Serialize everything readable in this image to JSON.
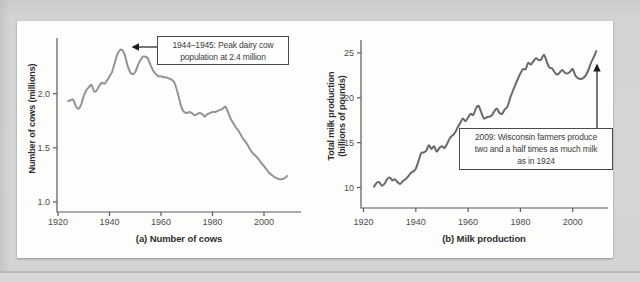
{
  "figure": {
    "kind": "textbook-two-panel-line-figure",
    "panel_a_caption": "(a) Number of cows",
    "panel_b_caption": "(b) Milk production"
  },
  "colors": {
    "page_bg": "#d4d5d2",
    "card_bg": "#fdfdfc",
    "axis": "#5b5b5b",
    "curve_a": "#939393",
    "curve_b": "#696969",
    "annotation_border": "#4a4a4a",
    "arrow": "#1b1b1b",
    "text": "#3a3a3a"
  },
  "chart_data": [
    {
      "type": "line",
      "caption": "(a) Number of cows",
      "ylabel": "Number of cows (millions)",
      "ylabel_lines": [
        "Number of cows (millions)"
      ],
      "x_ticks": [
        "1920",
        "1940",
        "1960",
        "1980",
        "2000"
      ],
      "y_ticks": [
        "1.0",
        "1.5",
        "2.0"
      ],
      "xlim": [
        1920,
        2013
      ],
      "ylim": [
        0.9,
        2.52
      ],
      "grid": false,
      "line_color": "#939393",
      "x_range": [
        1924,
        2009
      ],
      "x_step": 1,
      "values": [
        1.93,
        1.94,
        1.94,
        1.88,
        1.86,
        1.9,
        1.98,
        2.03,
        2.06,
        2.08,
        2.02,
        2.03,
        2.07,
        2.1,
        2.09,
        2.12,
        2.16,
        2.2,
        2.28,
        2.36,
        2.4,
        2.4,
        2.35,
        2.26,
        2.2,
        2.18,
        2.2,
        2.26,
        2.31,
        2.34,
        2.34,
        2.32,
        2.26,
        2.21,
        2.18,
        2.16,
        2.16,
        2.15,
        2.15,
        2.14,
        2.13,
        2.11,
        2.05,
        1.96,
        1.87,
        1.83,
        1.82,
        1.83,
        1.82,
        1.8,
        1.81,
        1.82,
        1.81,
        1.79,
        1.81,
        1.82,
        1.83,
        1.83,
        1.84,
        1.85,
        1.86,
        1.88,
        1.83,
        1.77,
        1.73,
        1.69,
        1.66,
        1.62,
        1.58,
        1.55,
        1.51,
        1.47,
        1.44,
        1.42,
        1.39,
        1.36,
        1.33,
        1.3,
        1.27,
        1.25,
        1.23,
        1.22,
        1.21,
        1.21,
        1.22,
        1.24
      ],
      "annotation": {
        "lines": [
          "1944–1945: Peak dairy cow",
          "population at 2.4 million"
        ],
        "points_to": {
          "year_range": "1944–1945",
          "value": 2.4
        }
      }
    },
    {
      "type": "line",
      "caption": "(b) Milk production",
      "ylabel": "Total milk production (billions of pounds)",
      "ylabel_lines": [
        "Total milk production",
        "(billions of pounds)"
      ],
      "x_ticks": [
        "1920",
        "1940",
        "1960",
        "1980",
        "2000"
      ],
      "y_ticks": [
        "10",
        "15",
        "20",
        "25"
      ],
      "xlim": [
        1920,
        2013
      ],
      "ylim": [
        7.8,
        26.3
      ],
      "grid": false,
      "line_color": "#696969",
      "x_range": [
        1924,
        2009
      ],
      "x_step": 1,
      "values": [
        10.1,
        10.5,
        10.6,
        10.2,
        10.4,
        10.9,
        11.1,
        10.8,
        10.9,
        10.6,
        10.4,
        10.7,
        10.9,
        11.2,
        11.6,
        11.8,
        12.1,
        12.9,
        13.8,
        13.9,
        14.1,
        14.7,
        14.3,
        14.6,
        14.0,
        14.4,
        14.6,
        14.4,
        14.9,
        15.5,
        15.8,
        16.1,
        16.7,
        17.2,
        17.7,
        17.4,
        17.8,
        18.2,
        18.1,
        18.8,
        19.1,
        18.4,
        17.7,
        17.8,
        17.9,
        18.0,
        18.5,
        18.8,
        18.3,
        18.2,
        18.7,
        19.0,
        19.9,
        20.7,
        21.4,
        22.1,
        22.7,
        23.2,
        23.2,
        23.9,
        23.7,
        24.1,
        24.4,
        24.2,
        24.3,
        24.8,
        24.1,
        23.4,
        23.3,
        22.9,
        22.6,
        22.8,
        23.1,
        22.8,
        22.7,
        22.9,
        23.2,
        22.5,
        22.2,
        22.1,
        22.2,
        22.5,
        23.1,
        23.9,
        24.5,
        25.2
      ],
      "annotation": {
        "lines": [
          "2009: Wisconsin farmers produce",
          "two and a half times as much milk",
          "as in 1924"
        ],
        "points_to": {
          "year": 2009,
          "value": 25.2
        }
      }
    }
  ]
}
